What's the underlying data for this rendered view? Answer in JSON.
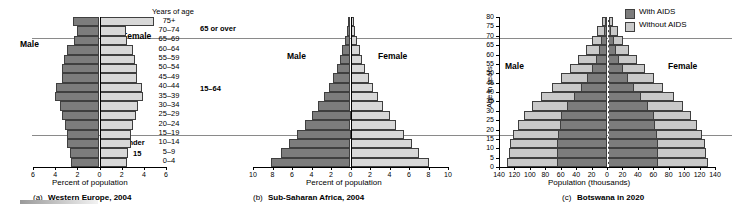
{
  "figure": {
    "rules": [
      "65-and-over-divider",
      "under-15-divider"
    ]
  },
  "panel_a": {
    "caption_prefix": "(a)",
    "caption": "Western Europe, 2004",
    "male_label": "Male",
    "female_label": "Female",
    "xaxis_title": "Percent of population",
    "age_header": "Years of age",
    "bracket_top": "65 or over",
    "bracket_mid": "15–64",
    "bracket_bottom_line1": "Under",
    "bracket_bottom_line2": "15",
    "xticks": [
      "6",
      "4",
      "2",
      "0",
      "2",
      "4",
      "6"
    ]
  },
  "panel_b": {
    "caption_prefix": "(b)",
    "caption": "Sub-Saharan Africa, 2004",
    "male_label": "Male",
    "female_label": "Female",
    "xaxis_title": "Percent of population",
    "xticks": [
      "10",
      "8",
      "6",
      "4",
      "2",
      "0",
      "2",
      "4",
      "6",
      "8",
      "10"
    ]
  },
  "panel_c": {
    "caption_prefix": "(c)",
    "caption": "Botswana in 2020",
    "male_label": "Male",
    "female_label": "Female",
    "xaxis_title": "Population (thousands)",
    "yaxis_title": "Age in years",
    "xticks": [
      "140",
      "120",
      "100",
      "80",
      "60",
      "40",
      "20",
      "0",
      "20",
      "40",
      "60",
      "80",
      "100",
      "120",
      "140"
    ],
    "yticks": [
      "0",
      "5",
      "10",
      "15",
      "20",
      "25",
      "30",
      "35",
      "40",
      "45",
      "50",
      "55",
      "60",
      "65",
      "70",
      "75",
      "80"
    ],
    "legend": [
      {
        "label": "With AIDS",
        "color": "#7c7c7c"
      },
      {
        "label": "Without AIDS",
        "color": "#c9c9c9"
      }
    ]
  },
  "chart_data": [
    {
      "type": "bar",
      "id": "western-europe-2004",
      "title": "(a) Western Europe, 2004",
      "orientation": "horizontal-pyramid",
      "xlabel": "Percent of population",
      "ylabel": "Years of age",
      "xlim": [
        -6,
        6
      ],
      "grid": false,
      "categories": [
        "0–4",
        "5–9",
        "10–14",
        "15–19",
        "20–24",
        "25–29",
        "30–34",
        "35–39",
        "40–44",
        "45–49",
        "50–54",
        "55–59",
        "60–64",
        "65–69",
        "70–74",
        "75+"
      ],
      "series": [
        {
          "name": "Male",
          "side": "left",
          "values": [
            2.6,
            2.7,
            2.9,
            2.9,
            3.1,
            3.4,
            3.6,
            4.0,
            3.9,
            3.4,
            3.4,
            3.2,
            2.9,
            2.3,
            2.0,
            2.4
          ]
        },
        {
          "name": "Female",
          "side": "right",
          "values": [
            2.5,
            2.6,
            2.8,
            2.8,
            3.0,
            3.3,
            3.5,
            3.9,
            3.8,
            3.4,
            3.4,
            3.2,
            3.0,
            2.5,
            2.4,
            4.9
          ]
        }
      ]
    },
    {
      "type": "bar",
      "id": "sub-saharan-africa-2004",
      "title": "(b) Sub-Saharan Africa, 2004",
      "orientation": "horizontal-pyramid",
      "xlabel": "Percent of population",
      "ylabel": "Years of age",
      "xlim": [
        -10,
        10
      ],
      "grid": false,
      "categories": [
        "0–4",
        "5–9",
        "10–14",
        "15–19",
        "20–24",
        "25–29",
        "30–34",
        "35–39",
        "40–44",
        "45–49",
        "50–54",
        "55–59",
        "60–64",
        "65–69",
        "70–74",
        "75+"
      ],
      "series": [
        {
          "name": "Male",
          "side": "left",
          "values": [
            8.2,
            7.1,
            6.3,
            5.5,
            4.7,
            4.0,
            3.3,
            2.7,
            2.2,
            1.8,
            1.4,
            1.1,
            0.85,
            0.6,
            0.4,
            0.3
          ]
        },
        {
          "name": "Female",
          "side": "right",
          "values": [
            8.1,
            7.0,
            6.3,
            5.5,
            4.7,
            4.0,
            3.3,
            2.8,
            2.3,
            1.9,
            1.5,
            1.2,
            0.95,
            0.7,
            0.5,
            0.4
          ]
        }
      ]
    },
    {
      "type": "bar",
      "id": "botswana-2020",
      "title": "(c) Botswana in 2020",
      "orientation": "horizontal-pyramid",
      "xlabel": "Population (thousands)",
      "ylabel": "Age in years",
      "xlim": [
        -140,
        140
      ],
      "grid": false,
      "categories": [
        "0–4",
        "5–9",
        "10–14",
        "15–19",
        "20–24",
        "25–29",
        "30–34",
        "35–39",
        "40–44",
        "45–49",
        "50–54",
        "55–59",
        "60–64",
        "65–69",
        "70–74",
        "75–79"
      ],
      "series": [
        {
          "name": "Male, With AIDS",
          "side": "left",
          "values": [
            66,
            66,
            66,
            64,
            62,
            60,
            52,
            44,
            34,
            26,
            20,
            15,
            11,
            8,
            5,
            3
          ]
        },
        {
          "name": "Male, Without AIDS",
          "side": "left",
          "values": [
            130,
            128,
            126,
            122,
            116,
            108,
            98,
            86,
            72,
            60,
            48,
            38,
            28,
            20,
            13,
            7
          ]
        },
        {
          "name": "Female, With AIDS",
          "side": "right",
          "values": [
            66,
            66,
            66,
            64,
            62,
            60,
            52,
            44,
            34,
            26,
            20,
            15,
            11,
            8,
            5,
            3
          ]
        },
        {
          "name": "Female, Without AIDS",
          "side": "right",
          "values": [
            130,
            128,
            126,
            122,
            116,
            108,
            98,
            86,
            72,
            60,
            48,
            38,
            28,
            20,
            13,
            7
          ]
        }
      ]
    }
  ]
}
